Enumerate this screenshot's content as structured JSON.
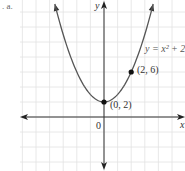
{
  "part_label": ". a.",
  "chart_data": {
    "type": "line",
    "title": "",
    "function": "y = x^2 + 2",
    "legend_label": "y = x² + 2",
    "xlabel": "x",
    "ylabel": "y",
    "origin_label": "0",
    "xlim": [
      -6,
      6
    ],
    "ylim": [
      -7,
      14
    ],
    "grid": true,
    "x": [
      -3,
      -2.5,
      -2,
      -1.5,
      -1,
      -0.5,
      0,
      0.5,
      1,
      1.5,
      2,
      2.5,
      3
    ],
    "y": [
      11,
      8.25,
      6,
      4.25,
      3,
      2.25,
      2,
      2.25,
      3,
      4.25,
      6,
      8.25,
      11
    ],
    "points": [
      {
        "x": 0,
        "y": 2,
        "label": "(0, 2)"
      },
      {
        "x": 2,
        "y": 6,
        "label": "(2, 6)"
      }
    ],
    "colors": {
      "curve": "#555555",
      "axis": "#333333",
      "grid": "#e0e0e0",
      "point": "#111111"
    }
  }
}
